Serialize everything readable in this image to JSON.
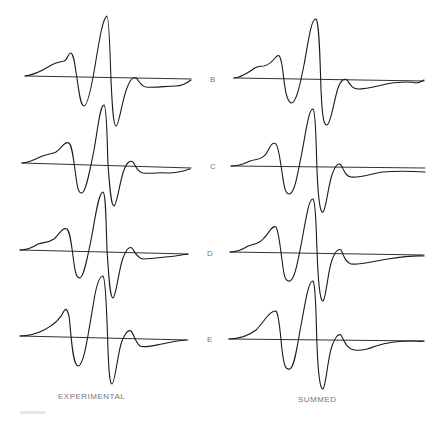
{
  "columns": [
    {
      "key": "experimental",
      "label": "EXPERIMENTAL"
    },
    {
      "key": "summed",
      "label": "SUMMED"
    }
  ],
  "rows": [
    {
      "label": "B"
    },
    {
      "label": "C"
    },
    {
      "label": "D"
    },
    {
      "label": "E"
    }
  ],
  "line_color": "#1a1a1a"
}
